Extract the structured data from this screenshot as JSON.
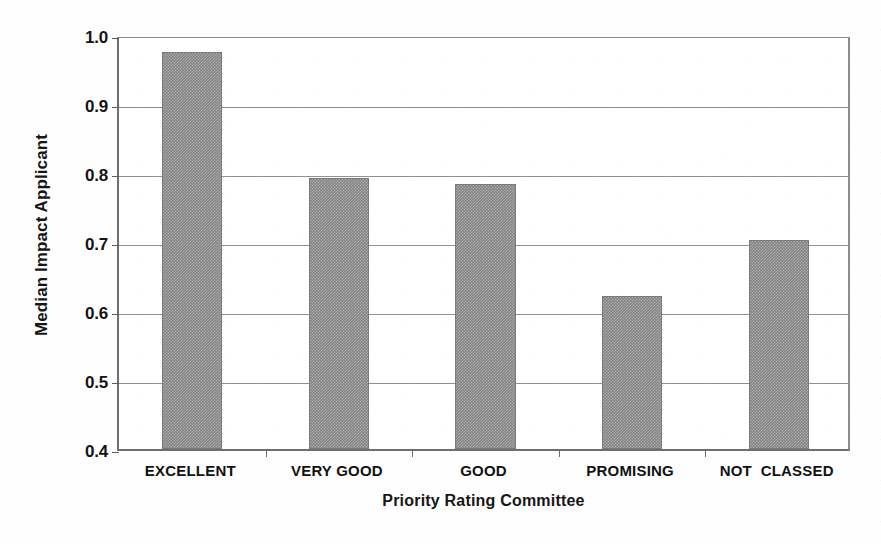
{
  "chart_data": {
    "type": "bar",
    "title": "",
    "xlabel": "Priority Rating Committee",
    "ylabel": "Median Impact Applicant",
    "categories": [
      "EXCELLENT",
      "VERY GOOD",
      "GOOD",
      "PROMISING",
      "NOT  CLASSED"
    ],
    "values": [
      0.975,
      0.793,
      0.784,
      0.622,
      0.703
    ],
    "ylim": [
      0.4,
      1.0
    ],
    "ytick_labels": [
      "1.0",
      "0.9",
      "0.8",
      "0.7",
      "0.6",
      "0.5",
      "0.4"
    ],
    "ytick_values": [
      1.0,
      0.9,
      0.8,
      0.7,
      0.6,
      0.5,
      0.4
    ],
    "grid": true,
    "legend": "none",
    "bar_color": "#848484",
    "axis_color": "#6e6e6e",
    "gridline_color": "#909090",
    "background_color": "#ffffff"
  }
}
